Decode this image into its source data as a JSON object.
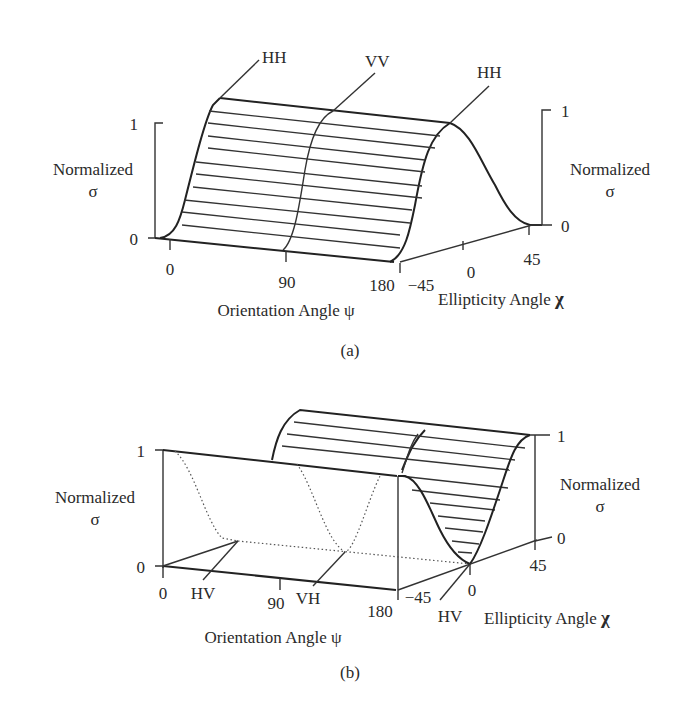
{
  "figure_a": {
    "caption": "(a)",
    "callouts": [
      "HH",
      "VV",
      "HH"
    ],
    "left_axis": {
      "label_line1": "Normalized",
      "label_line2": "σ",
      "tick_top": "1",
      "tick_bottom": "0"
    },
    "right_axis": {
      "label_line1": "Normalized",
      "label_line2": "σ",
      "tick_top": "1",
      "tick_bottom": "0"
    },
    "orientation_axis": {
      "label": "Orientation Angle ψ",
      "ticks": [
        "0",
        "90",
        "180"
      ]
    },
    "ellipticity_axis": {
      "label": "Ellipticity Angle",
      "symbol": "χ",
      "ticks": [
        "−45",
        "0",
        "45"
      ]
    }
  },
  "figure_b": {
    "caption": "(b)",
    "callouts": [
      "HV",
      "VH",
      "HV"
    ],
    "left_axis": {
      "label_line1": "Normalized",
      "label_line2": "σ",
      "tick_top": "1",
      "tick_bottom": "0"
    },
    "right_axis": {
      "label_line1": "Normalized",
      "label_line2": "σ",
      "tick_top": "1",
      "tick_bottom": "0"
    },
    "orientation_axis": {
      "label": "Orientation Angle ψ",
      "ticks": [
        "0",
        "90",
        "180"
      ]
    },
    "ellipticity_axis": {
      "label": "Ellipticity Angle",
      "symbol": "χ",
      "ticks": [
        "−45",
        "0",
        "45"
      ]
    }
  },
  "colors": {
    "ink": "#222222",
    "background": "#ffffff"
  }
}
